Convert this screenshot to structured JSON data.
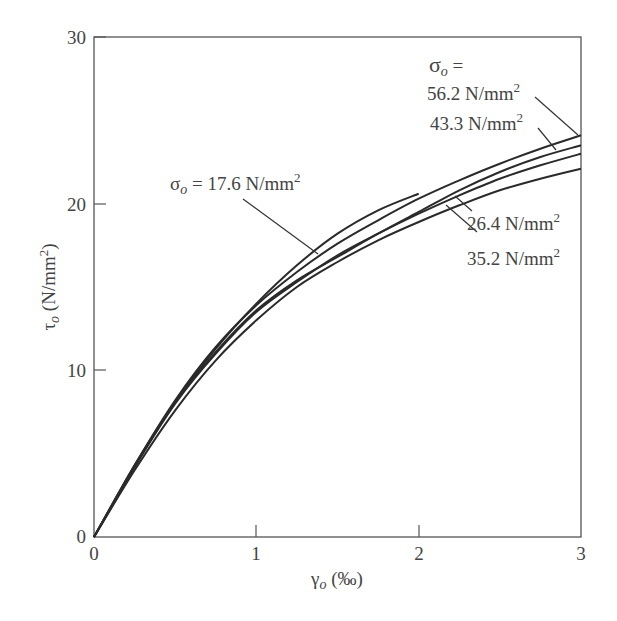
{
  "chart_data": {
    "type": "line",
    "title": "",
    "xlabel": "γo (‰)",
    "ylabel": "τo (N/mm²)",
    "xlim": [
      0,
      3
    ],
    "ylim": [
      0,
      30
    ],
    "xticks": [
      0,
      1,
      2,
      3
    ],
    "yticks": [
      0,
      10,
      20,
      30
    ],
    "grid": false,
    "legend_position": "inline annotations",
    "series": [
      {
        "name": "σo = 17.6 N/mm²",
        "x": [
          0,
          0.25,
          0.5,
          0.75,
          1.0,
          1.25,
          1.5,
          1.75,
          2.0
        ],
        "y": [
          0,
          4.2,
          8.1,
          11.3,
          14.0,
          16.3,
          18.2,
          19.6,
          20.6
        ]
      },
      {
        "name": "σo = 26.4 N/mm²",
        "x": [
          0,
          0.25,
          0.5,
          0.75,
          1.0,
          1.25,
          1.5,
          1.75,
          2.0,
          2.25,
          2.5,
          2.75,
          3.0
        ],
        "y": [
          0,
          4.2,
          8.0,
          11.0,
          13.5,
          15.3,
          16.9,
          18.2,
          19.4,
          20.5,
          21.5,
          22.3,
          23.0
        ]
      },
      {
        "name": "σo = 35.2 N/mm²",
        "x": [
          0,
          0.25,
          0.5,
          0.75,
          1.0,
          1.25,
          1.5,
          1.75,
          2.0,
          2.25,
          2.5,
          2.75,
          3.0
        ],
        "y": [
          0,
          4.0,
          7.6,
          10.6,
          13.0,
          15.0,
          16.5,
          17.8,
          18.9,
          19.9,
          20.8,
          21.5,
          22.1
        ]
      },
      {
        "name": "σo = 43.3 N/mm²",
        "x": [
          0,
          0.25,
          0.5,
          0.75,
          1.0,
          1.25,
          1.5,
          1.75,
          2.0,
          2.25,
          2.5,
          2.75,
          3.0
        ],
        "y": [
          0,
          4.3,
          8.1,
          11.1,
          13.6,
          15.4,
          16.8,
          18.2,
          19.5,
          20.8,
          21.9,
          22.8,
          23.5
        ]
      },
      {
        "name": "σo = 56.2 N/mm²",
        "x": [
          0,
          0.25,
          0.5,
          0.75,
          1.0,
          1.25,
          1.5,
          1.75,
          2.0,
          2.25,
          2.5,
          2.75,
          3.0
        ],
        "y": [
          0,
          4.3,
          8.2,
          11.4,
          13.9,
          15.9,
          17.6,
          19.0,
          20.3,
          21.4,
          22.4,
          23.3,
          24.1
        ]
      }
    ],
    "annotations": [
      {
        "text": "σo = 17.6 N/mm²",
        "target": "σo = 17.6 N/mm²"
      },
      {
        "text": "σo =",
        "target": "header"
      },
      {
        "text": "56.2 N/mm²",
        "target": "σo = 56.2 N/mm²"
      },
      {
        "text": "43.3 N/mm²",
        "target": "σo = 43.3 N/mm²"
      },
      {
        "text": "26.4 N/mm²",
        "target": "σo = 26.4 N/mm²"
      },
      {
        "text": "35.2 N/mm²",
        "target": "σo = 35.2 N/mm²"
      }
    ]
  },
  "axes": {
    "x_ticks": [
      "0",
      "1",
      "2",
      "3"
    ],
    "y_ticks": [
      "0",
      "10",
      "20",
      "30"
    ],
    "x_title_symbol": "γ",
    "x_title_sub": "o",
    "x_title_unit": " (‰)",
    "y_title_symbol": "τ",
    "y_title_sub": "o",
    "y_title_unit": " (N/mm",
    "y_title_sup": "2",
    "y_title_close": ")"
  },
  "labels": {
    "s176_sym": "σ",
    "s176_sub": "o",
    "s176_text": " = 17.6 N/mm",
    "header_sym": "σ",
    "header_sub": "o",
    "header_eq": " =",
    "s562_text": "56.2 N/mm",
    "s433_text": "43.3 N/mm",
    "s264_text": "26.4 N/mm",
    "s352_text": "35.2 N/mm",
    "sup2": "2"
  },
  "colors": {
    "line": "#2a2a2a",
    "axis": "#555555",
    "text": "#444444"
  }
}
